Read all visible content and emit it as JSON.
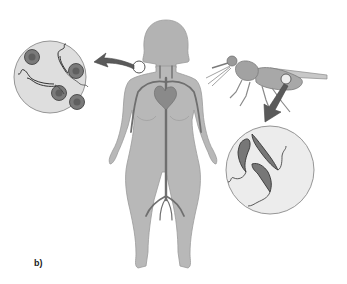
{
  "figure": {
    "panel_label": "b)",
    "elements": {
      "human": {
        "name": "human-figure",
        "shows": "circulatory system (heart, aorta, arteries)"
      },
      "fly": {
        "name": "tsetse-fly"
      },
      "blood_inset": {
        "name": "blood-inset",
        "contents": [
          "red blood cells",
          "trypanosomes"
        ],
        "red_blood_cell_count": 5,
        "trypanosome_count": 2
      },
      "fly_inset": {
        "name": "fly-gut-inset",
        "contents": [
          "trypanosomes"
        ],
        "trypanosome_count": 3
      }
    },
    "colors": {
      "body": "#b8b8b8",
      "body_outline": "#9a9a9a",
      "vessels": "#6f6f6f",
      "inset_fill": "#e2e2e2",
      "arrow": "#5a5a5a",
      "rbc": "#7a7a7a",
      "parasite": "#555555"
    }
  }
}
